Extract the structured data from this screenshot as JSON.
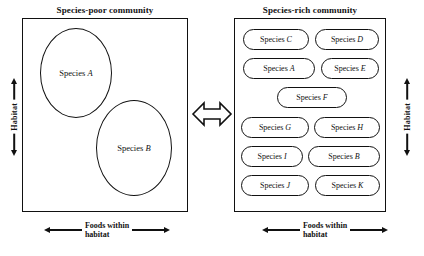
{
  "figure": {
    "background_color": "#ffffff",
    "stroke_color": "#111111"
  },
  "left_panel": {
    "title": "Species-poor community",
    "vertical_axis_label": "Habitat",
    "horizontal_axis_label_line1": "Foods within",
    "horizontal_axis_label_line2": "habitat",
    "niches": [
      {
        "prefix": "Species ",
        "letter": "A"
      },
      {
        "prefix": "Species ",
        "letter": "B"
      }
    ]
  },
  "center": {
    "icon": "double-headed-horizontal-arrow"
  },
  "right_panel": {
    "title": "Species-rich community",
    "vertical_axis_label": "Habitat",
    "horizontal_axis_label_line1": "Foods within",
    "horizontal_axis_label_line2": "habitat",
    "niches": [
      {
        "prefix": "Species ",
        "letter": "C"
      },
      {
        "prefix": "Species ",
        "letter": "D"
      },
      {
        "prefix": "Species ",
        "letter": "A"
      },
      {
        "prefix": "Species ",
        "letter": "E"
      },
      {
        "prefix": "Species ",
        "letter": "F"
      },
      {
        "prefix": "Species ",
        "letter": "G"
      },
      {
        "prefix": "Species ",
        "letter": "H"
      },
      {
        "prefix": "Species ",
        "letter": "I"
      },
      {
        "prefix": "Species ",
        "letter": "B"
      },
      {
        "prefix": "Species ",
        "letter": "J"
      },
      {
        "prefix": "Species ",
        "letter": "K"
      }
    ]
  }
}
